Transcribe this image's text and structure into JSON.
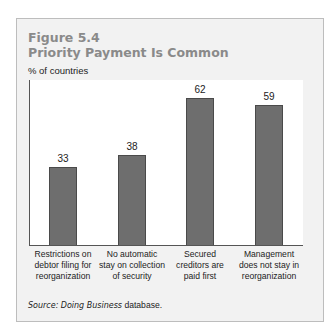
{
  "figure": {
    "number": "Figure 5.4",
    "title": "Priority Payment Is Common",
    "ylabel": "% of countries",
    "source_label": "Source:",
    "source_italic": "Doing Business",
    "source_rest": "database."
  },
  "bars": [
    {
      "value": "33",
      "label_lines": [
        "Restrictions on",
        "debtor filing for",
        "reorganization"
      ]
    },
    {
      "value": "38",
      "label_lines": [
        "No automatic",
        "stay on collection",
        "of security"
      ]
    },
    {
      "value": "62",
      "label_lines": [
        "Secured",
        "creditors are",
        "paid first"
      ]
    },
    {
      "value": "59",
      "label_lines": [
        "Management",
        "does not stay in",
        "reorganization"
      ]
    }
  ],
  "colors": {
    "bar": "#6e6e6e",
    "title": "#8a8a8a",
    "frame_bg": "#f2f2f2",
    "plot_bg": "#ffffff"
  },
  "chart_data": {
    "type": "bar",
    "xlabel": "",
    "ylabel": "% of countries",
    "categories": [
      "Restrictions on debtor filing for reorganization",
      "No automatic stay on collection of security",
      "Secured creditors are paid first",
      "Management does not stay in reorganization"
    ],
    "values": [
      33,
      38,
      62,
      59
    ],
    "ylim": [
      0,
      70
    ],
    "grid": false,
    "legend": null,
    "source": "Source: Doing Business database."
  }
}
